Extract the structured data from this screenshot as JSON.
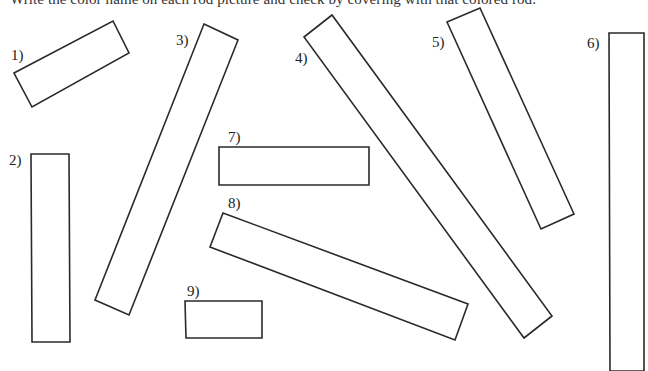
{
  "worksheet": {
    "instruction": "Write the color name on each rod picture and check by covering with that colored rod.",
    "stroke_color": "#2a2a2a",
    "background_color": "#ffffff"
  },
  "rods": [
    {
      "label": "1)",
      "label_pos": [
        11,
        48
      ],
      "points": "14,73 113,21 129,53 32,107"
    },
    {
      "label": "2)",
      "label_pos": [
        9,
        153
      ],
      "points": "31,154 69,154 70,342 32,342"
    },
    {
      "label": "3)",
      "label_pos": [
        176,
        33
      ],
      "points": "204,24 238,40 129,315 95,300"
    },
    {
      "label": "4)",
      "label_pos": [
        295,
        51
      ],
      "points": "304,37 332,15 552,316 524,338"
    },
    {
      "label": "5)",
      "label_pos": [
        432,
        35
      ],
      "points": "447,22 480,8 574,214 541,229"
    },
    {
      "label": "6)",
      "label_pos": [
        587,
        36
      ],
      "points": "609,33 644,33 644,371 610,371"
    },
    {
      "label": "7)",
      "label_pos": [
        228,
        130
      ],
      "points": "219,147 369,147 369,185 219,185"
    },
    {
      "label": "8)",
      "label_pos": [
        228,
        196
      ],
      "points": "223,213 468,304 455,340 210,247"
    },
    {
      "label": "9)",
      "label_pos": [
        187,
        284
      ],
      "points": "185,301 262,301 262,338 186,338"
    }
  ]
}
